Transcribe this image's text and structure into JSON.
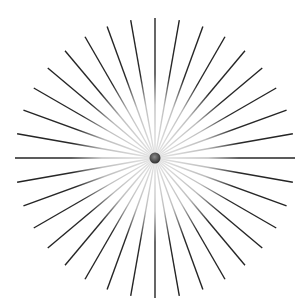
{
  "figure": {
    "width": 308,
    "height": 308,
    "center": {
      "x": 155,
      "y": 158
    },
    "radius": 140,
    "line_count": 36,
    "angle_step_deg": 10,
    "line_color": "#222222",
    "inner_fade_color": "#e6e6e6",
    "fade_radius": 55,
    "line_width": 1.4,
    "dot": {
      "radius": 5.5,
      "color": "#3a3a3a",
      "highlight": "#8a8a8a"
    },
    "background": "#ffffff"
  }
}
